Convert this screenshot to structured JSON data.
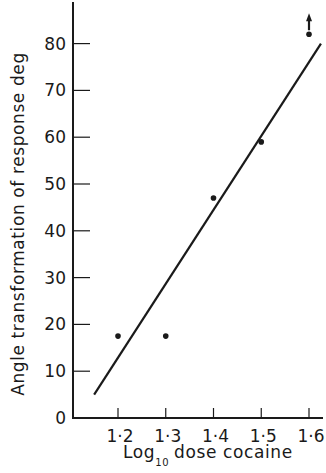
{
  "chart_data": {
    "type": "scatter",
    "title": "",
    "xlabel": "Log10 dose cocaine",
    "xlabel_main": "Log",
    "xlabel_sub": "10",
    "xlabel_rest": "dose cocaine",
    "ylabel": "Angle transformation of response deg",
    "xlim": [
      1.1,
      1.62
    ],
    "ylim": [
      0,
      90
    ],
    "x_ticks": [
      1.2,
      1.3,
      1.4,
      1.5,
      1.6
    ],
    "x_tick_labels": [
      "1·2",
      "1·3",
      "1·4",
      "1·5",
      "1·6"
    ],
    "y_ticks": [
      0,
      10,
      20,
      30,
      40,
      50,
      60,
      70,
      80
    ],
    "y_tick_labels": [
      "0",
      "10",
      "20",
      "30",
      "40",
      "50",
      "60",
      "70",
      "80"
    ],
    "grid": false,
    "legend": null,
    "series": [
      {
        "name": "observed responses",
        "type": "scatter",
        "points": [
          {
            "x": 1.2,
            "y": 17.5
          },
          {
            "x": 1.3,
            "y": 17.5
          },
          {
            "x": 1.4,
            "y": 47
          },
          {
            "x": 1.5,
            "y": 59
          },
          {
            "x": 1.6,
            "y": 82,
            "annotation": "arrow-up (value exceeds plotted)"
          }
        ]
      },
      {
        "name": "fitted regression line",
        "type": "line",
        "points": [
          {
            "x": 1.15,
            "y": 5
          },
          {
            "x": 1.625,
            "y": 80
          }
        ]
      }
    ]
  }
}
